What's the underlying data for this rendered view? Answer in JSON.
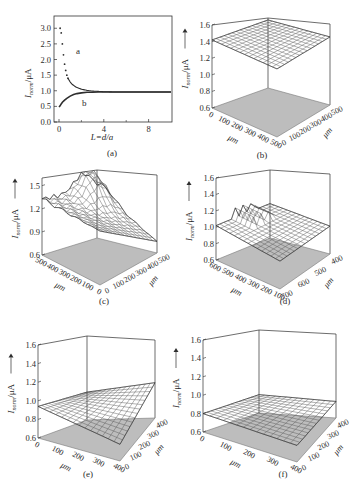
{
  "figure": {
    "ink_color": "#2e2e2e",
    "floor_color": "#bdbdbd",
    "surface_color": "#555555",
    "background": "#ffffff"
  },
  "chart_data": [
    {
      "panel": "(a)",
      "type": "scatter",
      "title": "",
      "xlabel": "L=d/a",
      "ylabel": "I_norm/μA",
      "xlim": [
        -0.5,
        10
      ],
      "ylim": [
        0.0,
        3.2
      ],
      "xticks": [
        0,
        4,
        8
      ],
      "yticks": [
        0.0,
        0.5,
        1.0,
        1.5,
        2.0,
        2.5,
        3.0
      ],
      "grid": false,
      "annotations": [
        {
          "text": "a",
          "x": 2.2,
          "y": 2.1
        },
        {
          "text": "b",
          "x": 2.4,
          "y": 0.75
        }
      ],
      "series": [
        {
          "name": "a",
          "x": [
            0.1,
            0.2,
            0.3,
            0.4,
            0.5,
            0.6,
            0.7,
            0.8,
            1.0,
            1.2,
            1.5,
            2.0,
            2.5,
            3.0,
            3.5,
            4.0,
            5.0,
            6.0,
            7.0,
            8.0,
            9.0,
            10.0
          ],
          "y": [
            3.0,
            2.85,
            2.5,
            2.15,
            1.85,
            1.65,
            1.5,
            1.4,
            1.28,
            1.2,
            1.12,
            1.05,
            1.01,
            0.99,
            0.98,
            0.97,
            0.96,
            0.96,
            0.96,
            0.96,
            0.96,
            0.96
          ]
        },
        {
          "name": "b",
          "x": [
            0.0,
            0.1,
            0.2,
            0.3,
            0.5,
            0.7,
            1.0,
            1.3,
            1.6,
            2.0,
            2.5,
            3.0,
            3.5,
            4.0,
            5.0,
            6.0,
            7.0,
            8.0,
            9.0,
            10.0
          ],
          "y": [
            0.48,
            0.52,
            0.58,
            0.63,
            0.7,
            0.76,
            0.83,
            0.88,
            0.91,
            0.93,
            0.95,
            0.955,
            0.96,
            0.96,
            0.96,
            0.96,
            0.96,
            0.96,
            0.96,
            0.96
          ]
        }
      ]
    },
    {
      "panel": "(b)",
      "type": "surface3d",
      "zlabel": "I_norm/μA",
      "zlim": [
        0.6,
        1.6
      ],
      "zticks": [
        "0.6",
        "0.8",
        "1.0",
        "1.2",
        "1.4",
        "1.6"
      ],
      "x_axis": {
        "label": "μm",
        "ticks": [
          "0",
          "100",
          "200",
          "300",
          "400",
          "500"
        ]
      },
      "y_axis": {
        "label": "μm",
        "ticks": [
          "0",
          "100",
          "200",
          "300",
          "400",
          "500"
        ]
      },
      "surface": {
        "shape": "flat",
        "level": 1.42
      }
    },
    {
      "panel": "(c)",
      "type": "surface3d",
      "zlabel": "I_norm/μA",
      "zlim": [
        0.6,
        1.6
      ],
      "zticks": [
        "0.6",
        "0.9",
        "1.2",
        "1.5"
      ],
      "x_axis": {
        "label": "μm",
        "ticks": [
          "500",
          "400",
          "300",
          "200",
          "100",
          "0"
        ]
      },
      "y_axis": {
        "label": "μm",
        "ticks": [
          "0",
          "100",
          "200",
          "300",
          "400",
          "500"
        ]
      },
      "surface": {
        "shape": "rough, peaks up to ~1.55 near back-right, sloping down to ~0.7 at front-right",
        "level": 1.2
      }
    },
    {
      "panel": "(d)",
      "type": "surface3d",
      "zlabel": "I_norm/μA",
      "zlim": [
        0.6,
        1.6
      ],
      "zticks": [
        "0.6",
        "0.8",
        "1.0",
        "1.2",
        "1.4",
        "1.6"
      ],
      "x_axis": {
        "label": "μm",
        "ticks": [
          "600",
          "500",
          "400",
          "300",
          "200",
          "100"
        ]
      },
      "y_axis": {
        "label": "μm",
        "ticks": [
          "700",
          "600",
          "500",
          "400"
        ]
      },
      "surface": {
        "shape": "near-flat ~1.0 with local spikes to ~1.2",
        "level": 1.0
      }
    },
    {
      "panel": "(e)",
      "type": "surface3d",
      "zlabel": "I_norm/μA",
      "zlim": [
        0.6,
        1.6
      ],
      "zticks": [
        "0.6",
        "0.8",
        "1.0",
        "1.2",
        "1.4",
        "1.6"
      ],
      "x_axis": {
        "label": "μm",
        "ticks": [
          "0",
          "100",
          "200",
          "300",
          "400"
        ]
      },
      "y_axis": {
        "label": "μm",
        "ticks": [
          "0",
          "100",
          "200",
          "300",
          "400"
        ]
      },
      "surface": {
        "shape": "smooth saddle ~0.8–1.0",
        "level": 0.9
      }
    },
    {
      "panel": "(f)",
      "type": "surface3d",
      "zlabel": "I_norm/μA",
      "zlim": [
        0.6,
        1.6
      ],
      "zticks": [
        "0.6",
        "0.8",
        "1.0",
        "1.2",
        "1.4",
        "1.6"
      ],
      "x_axis": {
        "label": "μm",
        "ticks": [
          "0",
          "100",
          "200",
          "300",
          "400"
        ]
      },
      "y_axis": {
        "label": "μm",
        "ticks": [
          "0",
          "100",
          "200",
          "300",
          "400"
        ]
      },
      "surface": {
        "shape": "flat",
        "level": 0.8
      }
    }
  ],
  "panels": {
    "a": {
      "caption": "(a)",
      "xlabel": "L=d/a",
      "ylabel_main": "I",
      "ylabel_sub": "norm",
      "ylabel_unit": "/μA",
      "curve_a_label": "a",
      "curve_b_label": "b",
      "yticks": [
        "0.0",
        "0.5",
        "1.0",
        "1.5",
        "2.0",
        "2.5",
        "3.0"
      ],
      "xticks": [
        "0",
        "4",
        "8"
      ]
    },
    "b": {
      "caption": "(b)",
      "unit": "μm"
    },
    "c": {
      "caption": "(c)",
      "unit": "μm"
    },
    "d": {
      "caption": "(d)",
      "unit": "μm"
    },
    "e": {
      "caption": "(e)",
      "unit": "μm"
    },
    "f": {
      "caption": "(f)",
      "unit": "μm"
    }
  }
}
